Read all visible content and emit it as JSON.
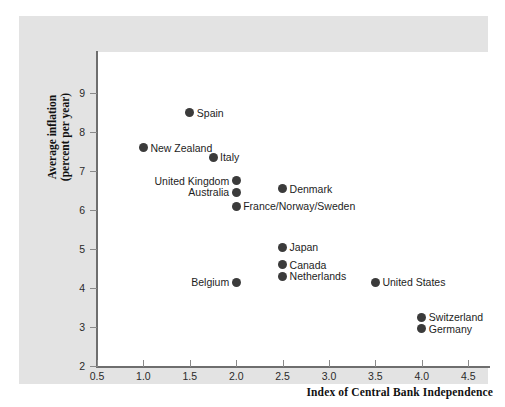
{
  "chart_data": {
    "type": "scatter",
    "title": "",
    "xlabel": "Index of Central Bank Independence",
    "ylabel_line1": "Average inflation",
    "ylabel_line2": "(percent per year)",
    "xlim": [
      0.5,
      4.75
    ],
    "ylim": [
      2,
      9.4
    ],
    "grid": false,
    "legend": "none",
    "xticks": [
      "0.5",
      "1.0",
      "1.5",
      "2.0",
      "2.5",
      "3.0",
      "3.5",
      "4.0",
      "4.5"
    ],
    "xtick_values": [
      0.5,
      1.0,
      1.5,
      2.0,
      2.5,
      3.0,
      3.5,
      4.0,
      4.5
    ],
    "yticks": [
      "2",
      "3",
      "4",
      "5",
      "6",
      "7",
      "8",
      "9"
    ],
    "ytick_values": [
      2,
      3,
      4,
      5,
      6,
      7,
      8,
      9
    ],
    "marker_color": "#3b3b3b",
    "points": [
      {
        "label": "Spain",
        "x": 1.5,
        "y": 8.5,
        "side": "right"
      },
      {
        "label": "New Zealand",
        "x": 1.0,
        "y": 7.6,
        "side": "right"
      },
      {
        "label": "Italy",
        "x": 1.75,
        "y": 7.35,
        "side": "right"
      },
      {
        "label": "United Kingdom",
        "x": 2.0,
        "y": 6.75,
        "side": "left"
      },
      {
        "label": "Australia",
        "x": 2.0,
        "y": 6.45,
        "side": "left"
      },
      {
        "label": "France/Norway/Sweden",
        "x": 2.0,
        "y": 6.1,
        "side": "right"
      },
      {
        "label": "Denmark",
        "x": 2.5,
        "y": 6.55,
        "side": "right"
      },
      {
        "label": "Japan",
        "x": 2.5,
        "y": 5.05,
        "side": "right"
      },
      {
        "label": "Canada",
        "x": 2.5,
        "y": 4.6,
        "side": "right"
      },
      {
        "label": "Netherlands",
        "x": 2.5,
        "y": 4.3,
        "side": "right"
      },
      {
        "label": "Belgium",
        "x": 2.0,
        "y": 4.15,
        "side": "left"
      },
      {
        "label": "United States",
        "x": 3.5,
        "y": 4.15,
        "side": "right"
      },
      {
        "label": "Switzerland",
        "x": 4.0,
        "y": 3.25,
        "side": "right"
      },
      {
        "label": "Germany",
        "x": 4.0,
        "y": 2.95,
        "side": "right"
      }
    ]
  }
}
